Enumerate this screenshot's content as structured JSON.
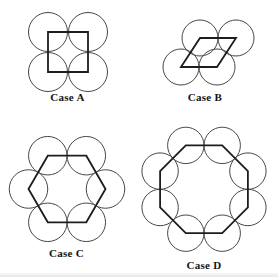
{
  "figure": {
    "background": "#ffffff",
    "circle_stroke": {
      "color": "#474747",
      "width": 1
    },
    "polygon_stroke": {
      "color": "#1d1d1d",
      "width": 1.8
    },
    "label_color": "#141414",
    "cases": [
      {
        "id": "case-a",
        "label": "Case A",
        "shape": "square",
        "circle_count": 4,
        "circle_radius": 19.5,
        "circle_centers": [
          [
            48,
            32
          ],
          [
            88,
            32
          ],
          [
            48,
            72
          ],
          [
            88,
            72
          ]
        ],
        "polygon": [
          [
            48,
            32
          ],
          [
            88,
            32
          ],
          [
            88,
            72
          ],
          [
            48,
            72
          ]
        ],
        "label_pos": [
          67.5,
          92
        ]
      },
      {
        "id": "case-b",
        "label": "Case B",
        "shape": "rhombus",
        "circle_count": 4,
        "circle_radius": 18,
        "circle_centers": [
          [
            200,
            38
          ],
          [
            236,
            38
          ],
          [
            181,
            67
          ],
          [
            217,
            67
          ]
        ],
        "polygon": [
          [
            181,
            67
          ],
          [
            200,
            38
          ],
          [
            236,
            38
          ],
          [
            217,
            67
          ]
        ],
        "label_pos": [
          205,
          92
        ]
      },
      {
        "id": "case-c",
        "label": "Case C",
        "shape": "hexagon",
        "circle_count": 6,
        "circle_radius": 19.25,
        "circle_centers": [
          [
            28.5,
            189
          ],
          [
            47.8,
            155.7
          ],
          [
            86.3,
            155.7
          ],
          [
            105.5,
            189
          ],
          [
            86.3,
            222.3
          ],
          [
            47.8,
            222.3
          ]
        ],
        "polygon": [
          [
            28.5,
            189
          ],
          [
            47.8,
            155.7
          ],
          [
            86.3,
            155.7
          ],
          [
            105.5,
            189
          ],
          [
            86.3,
            222.3
          ],
          [
            47.8,
            222.3
          ]
        ],
        "label_pos": [
          66.5,
          247.5
        ]
      },
      {
        "id": "case-d",
        "label": "Case D",
        "shape": "octagon",
        "circle_count": 8,
        "circle_radius": 18.2,
        "circle_centers": [
          [
            185.8,
            145.4
          ],
          [
            222.2,
            145.4
          ],
          [
            247.9,
            171.1
          ],
          [
            247.9,
            207.5
          ],
          [
            222.2,
            233.2
          ],
          [
            185.8,
            233.2
          ],
          [
            160.1,
            207.5
          ],
          [
            160.1,
            171.1
          ]
        ],
        "polygon": [
          [
            185.8,
            145.4
          ],
          [
            222.2,
            145.4
          ],
          [
            247.9,
            171.1
          ],
          [
            247.9,
            207.5
          ],
          [
            222.2,
            233.2
          ],
          [
            185.8,
            233.2
          ],
          [
            160.1,
            207.5
          ],
          [
            160.1,
            171.1
          ]
        ],
        "label_pos": [
          204,
          259.5
        ]
      }
    ]
  }
}
